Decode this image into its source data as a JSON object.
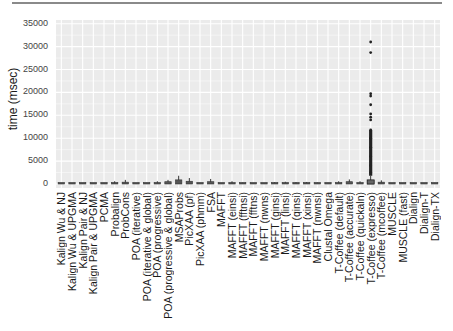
{
  "chart_data": {
    "type": "box",
    "title": "",
    "xlabel": "",
    "ylabel": "time (msec)",
    "ylim": [
      0,
      35000
    ],
    "yticks": [
      0,
      5000,
      10000,
      15000,
      20000,
      25000,
      30000,
      35000
    ],
    "grid": true,
    "legend": null,
    "categories": [
      "Kalign Wu & NJ",
      "Kalign Wu & UPGMA",
      "Kalign Pair & NJ",
      "Kalign Pair & UPGMA",
      "PCMA",
      "Probalign",
      "ProbCons",
      "POA (iterative)",
      "POA (iterative & global)",
      "POA (progressive)",
      "POA (progressive & global)",
      "MSAProbs",
      "PicXAA (pf)",
      "PicXAA (phmm)",
      "FSA",
      "MAFFT",
      "MAFFT (einsi)",
      "MAFFT (fftnsi)",
      "MAFFT (fftns)",
      "MAFFT (nwns)",
      "MAFFT (ginsi)",
      "MAFFT (linsi)",
      "MAFFT (qinsi)",
      "MAFFT (xinsi)",
      "MAFFT (nwnsi)",
      "Clustal Omega",
      "T-Coffee (default)",
      "T-Coffee (accurate)",
      "T-Coffee (quickaln)",
      "T-Coffee (expresso)",
      "T-Coffee (mcoffee)",
      "MUSCLE",
      "MUSCLE (fast)",
      "Dialign",
      "Dialign-T",
      "Dialign-TX"
    ],
    "series": [
      {
        "name": "time",
        "median": [
          20,
          20,
          20,
          20,
          60,
          120,
          200,
          40,
          60,
          150,
          250,
          400,
          250,
          60,
          300,
          30,
          150,
          80,
          30,
          30,
          100,
          120,
          100,
          110,
          80,
          60,
          150,
          250,
          150,
          350,
          200,
          40,
          30,
          40,
          50,
          60
        ],
        "q3": [
          40,
          40,
          40,
          40,
          120,
          250,
          400,
          80,
          120,
          300,
          500,
          900,
          600,
          120,
          500,
          60,
          300,
          150,
          60,
          60,
          200,
          250,
          200,
          220,
          160,
          120,
          300,
          500,
          300,
          800,
          400,
          80,
          60,
          80,
          100,
          120
        ],
        "whisker_high": [
          80,
          80,
          80,
          80,
          250,
          600,
          900,
          150,
          250,
          600,
          900,
          1800,
          1300,
          250,
          1100,
          120,
          600,
          300,
          120,
          120,
          400,
          500,
          400,
          450,
          320,
          250,
          600,
          1000,
          600,
          1800,
          800,
          160,
          120,
          160,
          200,
          250
        ],
        "outliers": {
          "T-Coffee (expresso)": [
            31000,
            28700,
            19700,
            19200,
            17300,
            15300,
            14600,
            14000,
            11800,
            10000,
            8000,
            6000,
            4000,
            2500
          ]
        }
      }
    ]
  },
  "page": {
    "ylabel": "time (msec)",
    "ytick_labels": [
      "35000",
      "30000",
      "25000",
      "20000",
      "15000",
      "10000",
      "5000",
      "0"
    ]
  }
}
